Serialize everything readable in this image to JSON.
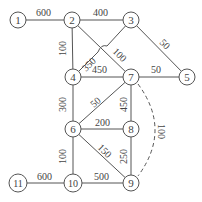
{
  "graph": {
    "nodes": [
      {
        "id": "1",
        "x": 18,
        "y": 20
      },
      {
        "id": "2",
        "x": 72,
        "y": 20
      },
      {
        "id": "3",
        "x": 131,
        "y": 20
      },
      {
        "id": "4",
        "x": 73,
        "y": 77
      },
      {
        "id": "7",
        "x": 131,
        "y": 77
      },
      {
        "id": "5",
        "x": 187,
        "y": 77
      },
      {
        "id": "6",
        "x": 73,
        "y": 129
      },
      {
        "id": "8",
        "x": 131,
        "y": 129
      },
      {
        "id": "9",
        "x": 131,
        "y": 183
      },
      {
        "id": "10",
        "x": 73,
        "y": 183
      },
      {
        "id": "11",
        "x": 18,
        "y": 183
      }
    ],
    "edges": [
      {
        "from": "1",
        "to": "2",
        "weight": "600"
      },
      {
        "from": "2",
        "to": "3",
        "weight": "400"
      },
      {
        "from": "2",
        "to": "4",
        "weight": "100"
      },
      {
        "from": "2",
        "to": "7",
        "weight": "100"
      },
      {
        "from": "4",
        "to": "3",
        "weight": "350"
      },
      {
        "from": "3",
        "to": "5",
        "weight": "50"
      },
      {
        "from": "4",
        "to": "7",
        "weight": "450"
      },
      {
        "from": "7",
        "to": "5",
        "weight": "50"
      },
      {
        "from": "4",
        "to": "6",
        "weight": "300"
      },
      {
        "from": "6",
        "to": "7",
        "weight": "50"
      },
      {
        "from": "7",
        "to": "8",
        "weight": "450"
      },
      {
        "from": "7",
        "to": "9",
        "weight": "100",
        "style": "dashed"
      },
      {
        "from": "6",
        "to": "8",
        "weight": "200"
      },
      {
        "from": "6",
        "to": "9",
        "weight": "150"
      },
      {
        "from": "8",
        "to": "9",
        "weight": "250"
      },
      {
        "from": "6",
        "to": "10",
        "weight": "100"
      },
      {
        "from": "10",
        "to": "9",
        "weight": "500"
      },
      {
        "from": "11",
        "to": "10",
        "weight": "600"
      }
    ]
  }
}
